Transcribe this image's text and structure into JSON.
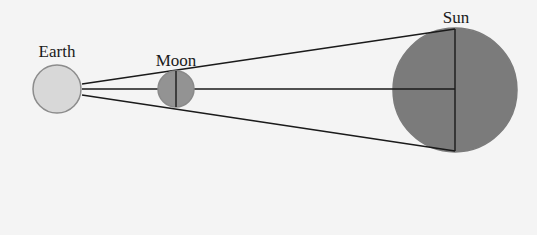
{
  "diagram": {
    "background": "#f4f4f4",
    "line_color": "#1a1a1a",
    "bodies": [
      {
        "id": "earth",
        "label": "Earth",
        "cx": 57,
        "cy": 89,
        "r": 24,
        "fill": "#d8d8d8",
        "stroke": "#8c8c8c",
        "label_x": 57,
        "label_y": 57
      },
      {
        "id": "moon",
        "label": "Moon",
        "cx": 176,
        "cy": 89,
        "r": 18,
        "fill": "#939393",
        "stroke": "#8a8a8a",
        "label_x": 176,
        "label_y": 66
      },
      {
        "id": "sun",
        "label": "Sun",
        "cx": 455,
        "cy": 90,
        "r": 62,
        "fill": "#7b7b7b",
        "stroke": "#7b7b7b",
        "label_x": 456,
        "label_y": 23
      }
    ],
    "sight_lines": [
      {
        "name": "upper-tangent-line",
        "x1": 82,
        "y1": 84,
        "x2": 455,
        "y2": 29
      },
      {
        "name": "center-line",
        "x1": 82,
        "y1": 89,
        "x2": 455,
        "y2": 89
      },
      {
        "name": "lower-tangent-line",
        "x1": 82,
        "y1": 95,
        "x2": 455,
        "y2": 151
      }
    ],
    "moon_vertical": {
      "x1": 176,
      "y1": 71,
      "x2": 176,
      "y2": 107
    },
    "sun_vertical": {
      "x1": 455,
      "y1": 29,
      "x2": 455,
      "y2": 151
    }
  }
}
